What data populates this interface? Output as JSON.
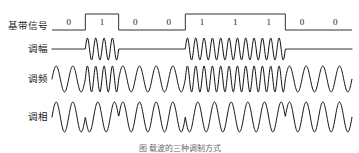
{
  "figure": {
    "title": "",
    "caption": "图  载波的三种调制方式",
    "background_color": "#ffffff",
    "line_color": "#111111",
    "text_color": "#1a1a1a"
  },
  "rows": [
    {
      "id": "baseband",
      "label": "基带信号",
      "type": "digital"
    },
    {
      "id": "am",
      "label": "调幅",
      "type": "ask"
    },
    {
      "id": "fm",
      "label": "调频",
      "type": "fsk"
    },
    {
      "id": "pm",
      "label": "调相",
      "type": "psk"
    }
  ],
  "chart_data": {
    "type": "line",
    "title": "载波的三种调制方式",
    "xlabel": "",
    "ylabel": "",
    "grid": false,
    "legend_position": "left-labels",
    "bit_sequence": [
      0,
      1,
      0,
      0,
      1,
      1,
      1,
      0,
      0
    ],
    "bit_labels": [
      "0",
      "1",
      "0",
      "0",
      "1",
      "1",
      "1",
      "0",
      "0"
    ],
    "bit_count": 9,
    "series": [
      {
        "name": "基带信号",
        "id": "baseband",
        "kind": "digital-nrz",
        "values": [
          0,
          1,
          0,
          0,
          1,
          1,
          1,
          0,
          0
        ],
        "low_level": 0,
        "high_level": 1
      },
      {
        "name": "调幅",
        "id": "am",
        "kind": "ask",
        "amplitude_for_bit0": 0.0,
        "amplitude_for_bit1": 1.0,
        "cycles_per_bit": 4,
        "values": [
          0,
          1,
          0,
          0,
          1,
          1,
          1,
          0,
          0
        ]
      },
      {
        "name": "调频",
        "id": "fm",
        "kind": "fsk",
        "cycles_per_bit_for_bit0": 2,
        "cycles_per_bit_for_bit1": 4,
        "amplitude": 1.0,
        "values": [
          0,
          1,
          0,
          0,
          1,
          1,
          1,
          0,
          0
        ]
      },
      {
        "name": "调相",
        "id": "pm",
        "kind": "psk",
        "cycles_per_bit": 2,
        "phase_for_bit0_deg": 0,
        "phase_for_bit1_deg": 180,
        "amplitude": 1.0,
        "values": [
          0,
          1,
          0,
          0,
          1,
          1,
          1,
          0,
          0
        ]
      }
    ]
  },
  "geometry": {
    "width": 359,
    "height": 153,
    "plot_left": 52,
    "plot_right": 352,
    "label_x": 48,
    "row_baseband_y": 26,
    "row_baseband_high": 8,
    "row_am_y": 49,
    "row_am_amp": 11,
    "row_fm_y": 79,
    "row_fm_amp": 13,
    "row_pm_y": 117,
    "row_pm_amp": 15,
    "caption_y": 145,
    "caption_x": 180
  }
}
